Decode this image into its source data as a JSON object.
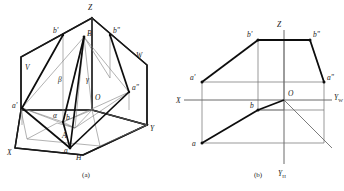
{
  "figure": {
    "captions": {
      "a": "(a)",
      "b": "(b)"
    },
    "stroke_color": "#1a1a1a",
    "thin_color": "#6b6b6b",
    "medium_color": "#3a3a3a"
  },
  "panel_a": {
    "name": "pictorial-three-plane-view",
    "planes": [
      {
        "id": "V",
        "label": "V"
      },
      {
        "id": "W",
        "label": "W"
      },
      {
        "id": "H",
        "label": "H"
      }
    ],
    "axes": [
      {
        "id": "X",
        "label": "X"
      },
      {
        "id": "Y",
        "label": "Y"
      },
      {
        "id": "Z",
        "label": "Z"
      }
    ],
    "origin_label": "O",
    "points": [
      {
        "id": "A",
        "label": "A"
      },
      {
        "id": "B",
        "label": "B"
      },
      {
        "id": "av",
        "label": "a'"
      },
      {
        "id": "bv",
        "label": "b'"
      },
      {
        "id": "aw",
        "label": "a\""
      },
      {
        "id": "bw",
        "label": "b\""
      },
      {
        "id": "ah",
        "label": "a"
      },
      {
        "id": "bh",
        "label": "b"
      }
    ],
    "angles": [
      {
        "id": "alpha",
        "label": "α"
      },
      {
        "id": "beta",
        "label": "β"
      },
      {
        "id": "gamma",
        "label": "γ"
      }
    ]
  },
  "panel_b": {
    "name": "unfolded-orthographic-projection",
    "axes": [
      {
        "id": "X",
        "label": "X",
        "sub": ""
      },
      {
        "id": "YW",
        "label": "Y",
        "sub": "W"
      },
      {
        "id": "YH",
        "label": "Y",
        "sub": "H"
      },
      {
        "id": "Z",
        "label": "Z",
        "sub": ""
      }
    ],
    "origin_label": "O",
    "points": [
      {
        "id": "av",
        "label": "a'"
      },
      {
        "id": "bv",
        "label": "b'"
      },
      {
        "id": "aw",
        "label": "a\""
      },
      {
        "id": "bw",
        "label": "b\""
      },
      {
        "id": "ah",
        "label": "a"
      },
      {
        "id": "bh",
        "label": "b"
      }
    ]
  }
}
